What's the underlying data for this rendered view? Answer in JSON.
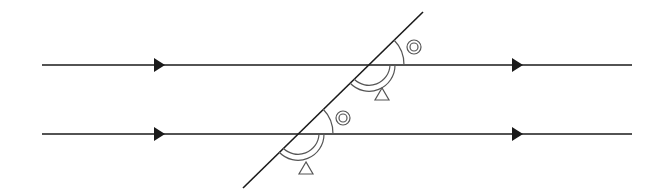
{
  "diagram": {
    "colors": {
      "stroke": "#1a1a1a",
      "marks": "#555555",
      "background": "#ffffff"
    },
    "parallel_lines": [
      {
        "id": "upper",
        "y": 65,
        "x1": 42,
        "x2": 632,
        "arrows_at_x": [
          158,
          516
        ]
      },
      {
        "id": "lower",
        "y": 134,
        "x1": 42,
        "x2": 632,
        "arrows_at_x": [
          158,
          516
        ]
      }
    ],
    "transversal": {
      "x1": 243,
      "y1": 188,
      "x2": 423,
      "y2": 12
    },
    "angle_marks": [
      {
        "type": "double-circle",
        "label": "corresponding angle (upper)",
        "symbol": "◎"
      },
      {
        "type": "triangle",
        "label": "corresponding angle (upper)",
        "symbol": "△"
      },
      {
        "type": "double-circle",
        "label": "corresponding angle (lower)",
        "symbol": "◎"
      },
      {
        "type": "triangle",
        "label": "corresponding angle (lower)",
        "symbol": "△"
      }
    ]
  }
}
